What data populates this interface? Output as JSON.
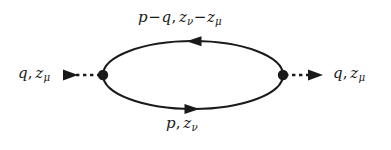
{
  "figure": {
    "type": "feynman-diagram",
    "background_color": "#ffffff",
    "ink_color": "#1a1a1a",
    "width": 391,
    "height": 150
  },
  "labels": {
    "top": {
      "full_text": "p−q, z_ν−z_μ",
      "momentum_symbol": "p",
      "momentum_operator": "−",
      "momentum_symbol2": "q",
      "comma": ",",
      "coord_symbol": "z",
      "coord_subscript": "ν",
      "coord_operator": "−",
      "coord_symbol2": "z",
      "coord_subscript2": "μ"
    },
    "bottom": {
      "full_text": "p, z_ν",
      "momentum_symbol": "p",
      "comma": ",",
      "coord_symbol": "z",
      "coord_subscript": "ν"
    },
    "left": {
      "full_text": "q, z_μ",
      "momentum_symbol": "q",
      "comma": ",",
      "coord_symbol": "z",
      "coord_subscript": "μ"
    },
    "right": {
      "full_text": "q, z_μ",
      "momentum_symbol": "q",
      "comma": ",",
      "coord_symbol": "z",
      "coord_subscript": "μ"
    }
  },
  "geometry": {
    "loop": {
      "center_x": 193,
      "center_y": 75,
      "radius_x": 90,
      "radius_y": 34,
      "stroke_width": 2.1
    },
    "vertices": [
      {
        "name": "left-vertex",
        "x": 103,
        "y": 75,
        "radius": 5.2
      },
      {
        "name": "right-vertex",
        "x": 283,
        "y": 75,
        "radius": 5.2
      }
    ],
    "loop_arrows": [
      {
        "name": "top-loop-arrow",
        "x": 196,
        "y": 41,
        "direction": "left"
      },
      {
        "name": "bottom-loop-arrow",
        "x": 190,
        "y": 109,
        "direction": "right"
      }
    ],
    "external_lines": [
      {
        "name": "incoming-external-line",
        "side": "left",
        "style": "dashed",
        "x_start": 63,
        "x_end": 103,
        "y": 75,
        "arrow_x": 70,
        "arrow_direction": "right"
      },
      {
        "name": "outgoing-external-line",
        "side": "right",
        "style": "dashed",
        "x_start": 283,
        "x_end": 322,
        "y": 75,
        "arrow_x": 322,
        "arrow_direction": "right"
      }
    ]
  }
}
